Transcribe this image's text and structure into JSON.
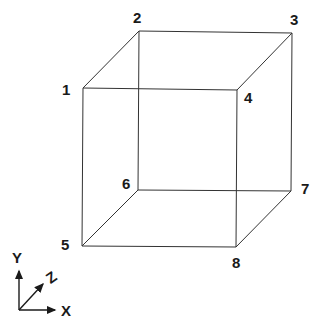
{
  "cube": {
    "vertices": [
      {
        "id": "1",
        "label": "1",
        "x": 83,
        "y": 88
      },
      {
        "id": "2",
        "label": "2",
        "x": 139,
        "y": 31
      },
      {
        "id": "3",
        "label": "3",
        "x": 292,
        "y": 33
      },
      {
        "id": "4",
        "label": "4",
        "x": 237,
        "y": 90
      },
      {
        "id": "5",
        "label": "5",
        "x": 82,
        "y": 246
      },
      {
        "id": "6",
        "label": "6",
        "x": 138,
        "y": 190
      },
      {
        "id": "7",
        "label": "7",
        "x": 291,
        "y": 191
      },
      {
        "id": "8",
        "label": "8",
        "x": 236,
        "y": 247
      }
    ],
    "edges": [
      [
        "1",
        "2"
      ],
      [
        "2",
        "3"
      ],
      [
        "3",
        "4"
      ],
      [
        "4",
        "1"
      ],
      [
        "5",
        "6"
      ],
      [
        "6",
        "7"
      ],
      [
        "7",
        "8"
      ],
      [
        "8",
        "5"
      ],
      [
        "1",
        "5"
      ],
      [
        "2",
        "6"
      ],
      [
        "3",
        "7"
      ],
      [
        "4",
        "8"
      ]
    ]
  },
  "axes": {
    "x_label": "X",
    "y_label": "Y",
    "z_label": "Z"
  }
}
